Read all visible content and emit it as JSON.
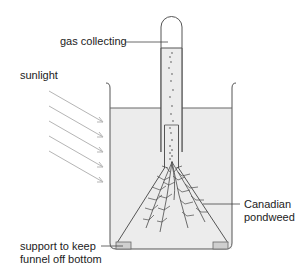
{
  "diagram": {
    "labels": {
      "gas_collecting": "gas collecting",
      "sunlight": "sunlight",
      "pondweed_line1": "Canadian",
      "pondweed_line2": "pondweed",
      "support_line1": "support to keep",
      "support_line2": "funnel off bottom"
    },
    "colors": {
      "stroke": "#555555",
      "water": "#ebebeb",
      "rays": "#b5b5b5",
      "plant": "#4a4a4a",
      "support": "#cfcfcf"
    },
    "components": [
      "test-tube",
      "beaker",
      "water",
      "funnel",
      "pondweed",
      "supports",
      "light-rays",
      "gas-bubbles"
    ]
  }
}
